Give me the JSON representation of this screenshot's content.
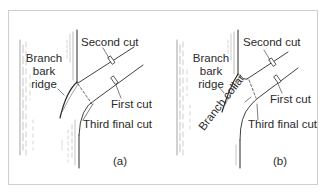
{
  "figure": {
    "panels": [
      {
        "id": "a",
        "caption": "(a)",
        "labels": {
          "branch_bark_ridge_1": "Branch",
          "branch_bark_ridge_2": "bark",
          "branch_bark_ridge_3": "ridge",
          "second_cut": "Second cut",
          "first_cut": "First cut",
          "third_final_cut": "Third final cut"
        }
      },
      {
        "id": "b",
        "caption": "(b)",
        "labels": {
          "branch_bark_ridge_1": "Branch",
          "branch_bark_ridge_2": "bark",
          "branch_bark_ridge_3": "ridge",
          "second_cut": "Second cut",
          "first_cut": "First cut",
          "third_final_cut": "Third final cut",
          "branch_collar": "Branch collar"
        }
      }
    ],
    "colors": {
      "line": "#2a2a2a",
      "border": "#cfcfcf",
      "background": "#ffffff"
    }
  }
}
